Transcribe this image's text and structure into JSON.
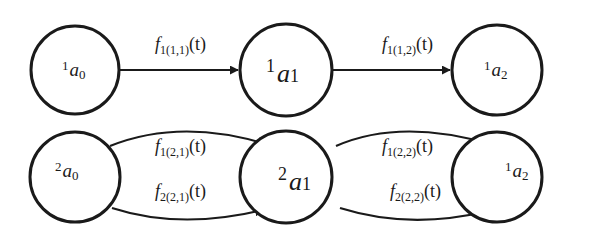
{
  "diagram": {
    "type": "state-transition",
    "rows": [
      {
        "nodes": [
          {
            "id": "1a0",
            "prefix": "1",
            "var": "a",
            "index": "0"
          },
          {
            "id": "1a1",
            "prefix": "1",
            "var": "a",
            "index": "1"
          },
          {
            "id": "1a2",
            "prefix": "1",
            "var": "a",
            "index": "2"
          }
        ],
        "edges": [
          {
            "from": "1a0",
            "to": "1a1",
            "f": "f",
            "sub": "1(1,1)",
            "arg": "(t)"
          },
          {
            "from": "1a1",
            "to": "1a2",
            "f": "f",
            "sub": "1(1,2)",
            "arg": "(t)"
          }
        ]
      },
      {
        "nodes": [
          {
            "id": "2a0",
            "prefix": "2",
            "var": "a",
            "index": "0"
          },
          {
            "id": "2a1",
            "prefix": "2",
            "var": "a",
            "index": "1"
          },
          {
            "id": "2a2",
            "prefix": "1",
            "var": "a",
            "index": "2"
          }
        ],
        "edges": [
          {
            "from": "2a0",
            "to": "2a1",
            "f": "f",
            "sub": "1(2,1)",
            "arg": "(t)",
            "curve": "upper"
          },
          {
            "from": "2a0",
            "to": "2a1",
            "f": "f",
            "sub": "2(2,1)",
            "arg": "(t)",
            "curve": "lower"
          },
          {
            "from": "2a1",
            "to": "2a2",
            "f": "f",
            "sub": "1(2,2)",
            "arg": "(t)",
            "curve": "upper"
          },
          {
            "from": "2a1",
            "to": "2a2",
            "f": "f",
            "sub": "2(2,2)",
            "arg": "(t)",
            "curve": "lower"
          }
        ]
      }
    ]
  }
}
